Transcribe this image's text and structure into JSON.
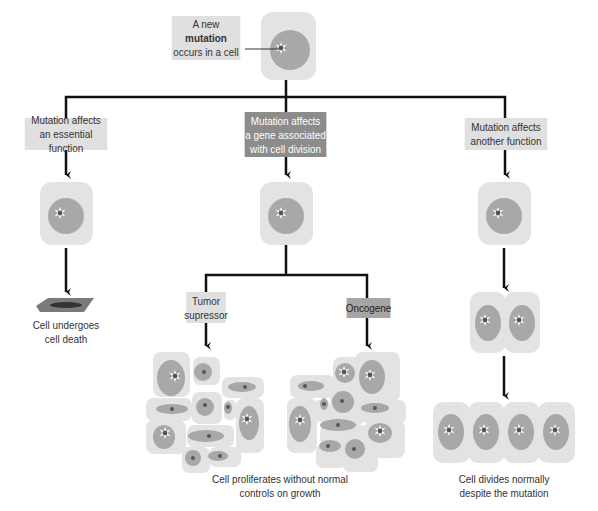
{
  "colors": {
    "cell_body": "#e3e3e3",
    "nucleus": "#a8a8a8",
    "mutation_core": "#555555",
    "label_light": "#e0e0e0",
    "label_dark": "#8c8c8c",
    "label_mid": "#a6a6a6",
    "line": "#111111",
    "dead_cell": "#6d6d6d"
  },
  "start": {
    "label_prefix": "A new ",
    "label_bold": "mutation",
    "label_suffix": "occurs in a cell"
  },
  "branches": {
    "left": {
      "label_line1": "Mutation affects",
      "label_line2": "an essential function",
      "outcome_line1": "Cell undergoes",
      "outcome_line2": "cell death"
    },
    "middle": {
      "label_line1": "Mutation affects",
      "label_line2": "a gene associated",
      "label_line3": "with cell division",
      "sub_left_line1": "Tumor",
      "sub_left_line2": "supressor",
      "sub_right": "Oncogene",
      "outcome_line1": "Cell proliferates without normal",
      "outcome_line2": "controls on growth"
    },
    "right": {
      "label_line1": "Mutation affects",
      "label_line2": "another function",
      "outcome_line1": "Cell divides normally",
      "outcome_line2": "despite the mutation"
    }
  }
}
